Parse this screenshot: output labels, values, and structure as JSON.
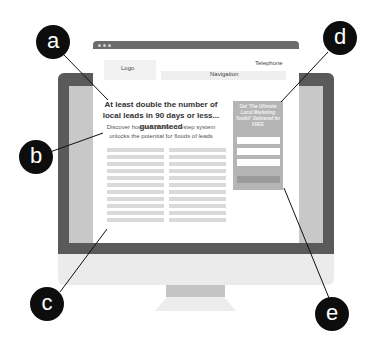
{
  "browser": {
    "window_dots": 3
  },
  "header": {
    "logo": "Logo",
    "telephone": "Telephone",
    "navigation": "Navigation"
  },
  "hero": {
    "headline": "At least double the number of local leads in 90 days or less... guaranteed",
    "subheadline": "Discover how our proven 10-step system unlocks the potential for floods of leads"
  },
  "body_copy": {
    "columns": 2,
    "lines_per_column": 10
  },
  "optin": {
    "title": "Get 'The Ultimate Local Marketing Toolkit' Delivered for FREE",
    "fields": 3,
    "button_label": ""
  },
  "callouts": [
    {
      "label": "a",
      "target": "headline"
    },
    {
      "label": "b",
      "target": "subheadline"
    },
    {
      "label": "c",
      "target": "body-copy"
    },
    {
      "label": "d",
      "target": "optin-box"
    },
    {
      "label": "e",
      "target": "optin-button"
    }
  ],
  "colors": {
    "bezel": "#5a5a5a",
    "screen_side": "#c8c8c8",
    "callout_bg": "#0d0d0d",
    "optin_bg": "#b5b5b5"
  }
}
